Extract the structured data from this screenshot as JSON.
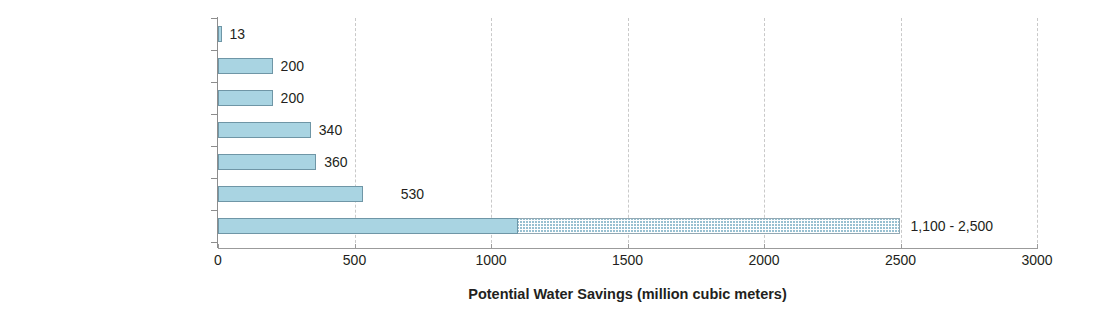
{
  "chart_data": {
    "type": "bar",
    "orientation": "horizontal",
    "title": "",
    "xlabel": "Potential Water Savings (million cubic meters)",
    "ylabel": "",
    "xlim": [
      0,
      3000
    ],
    "xticks": [
      0,
      500,
      1000,
      1500,
      2000,
      2500,
      3000
    ],
    "xtick_labels": [
      "0",
      "500",
      "1000",
      "1500",
      "2000",
      "2500",
      "3000"
    ],
    "grid": "vertical-dashed",
    "legend": "none",
    "categories": [
      "Dishwashers",
      "Faucets",
      "Showers",
      "Clothes washers",
      "Toilets",
      "Household leak repair",
      "Landscapes"
    ],
    "values": [
      13,
      200,
      200,
      340,
      360,
      530,
      2500
    ],
    "bars": [
      {
        "category": "Dishwashers",
        "value": 13,
        "range_low": null,
        "range_high": null,
        "label": "13",
        "label_offset": 8
      },
      {
        "category": "Faucets",
        "value": 200,
        "range_low": null,
        "range_high": null,
        "label": "200",
        "label_offset": 8
      },
      {
        "category": "Showers",
        "value": 200,
        "range_low": null,
        "range_high": null,
        "label": "200",
        "label_offset": 8
      },
      {
        "category": "Clothes washers",
        "value": 340,
        "range_low": null,
        "range_high": null,
        "label": "340",
        "label_offset": 8
      },
      {
        "category": "Toilets",
        "value": 360,
        "range_low": null,
        "range_high": null,
        "label": "360",
        "label_offset": 8
      },
      {
        "category": "Household leak repair",
        "value": 530,
        "range_low": null,
        "range_high": null,
        "label": "530",
        "label_offset": 38
      },
      {
        "category": "Landscapes",
        "value": 2500,
        "range_low": 1100,
        "range_high": 2500,
        "label": "1,100 - 2,500",
        "label_offset": 10
      }
    ],
    "colors": {
      "bar_fill": "#a9d4e2",
      "bar_border": "#6f96a6",
      "hatch_fill": "#ffffff",
      "hatch_pattern": "#87b6c9",
      "gridline": "#c9c9c9",
      "axis_line": "#9b9b9b",
      "text": "#231f20",
      "background": "#ffffff"
    }
  }
}
